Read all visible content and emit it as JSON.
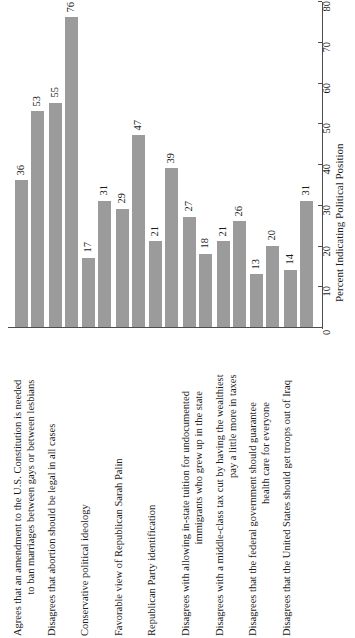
{
  "chart_data": {
    "type": "bar",
    "title": "",
    "subtitle": "",
    "xlabel": "",
    "ylabel": "Percent Indicating Political Position",
    "ylim": [
      0,
      80
    ],
    "yticks": [
      0,
      10,
      20,
      30,
      40,
      50,
      60,
      70,
      80
    ],
    "grid": false,
    "legend": "none",
    "orientation": "vertical-bars-rotated-page",
    "bar_color": "#9b9b9b",
    "categories": [
      "Agrees that an amendment to the U.S. Constitution is needed to ban marriages between gays or between lesbians",
      "Disagrees that abortion should be legal in all cases",
      "Conservative political ideology",
      "Favorable view of Republican Sarah Palin",
      "Republican Party identification",
      "Disagrees with allowing in-state tuition for undocumented immigrants who grew up in the state",
      "Disagrees with a middle-class tax cut by having the wealthiest pay a little more in taxes",
      "Disagrees that the federal government should guarantee health care for everyone",
      "Disagrees that the United States should get troops out of Iraq"
    ],
    "category_lines": [
      [
        "Agrees that an amendment to the U.S. Constitution is needed",
        "to ban marriages between gays or between lesbians"
      ],
      [
        "Disagrees that abortion should be legal in all cases"
      ],
      [
        "Conservative political ideology"
      ],
      [
        "Favorable view of Republican Sarah Palin"
      ],
      [
        "Republican Party identification"
      ],
      [
        "Disagrees with allowing in-state tuition for undocumented",
        "immigrants who grew up in the state"
      ],
      [
        "Disagrees with a middle-class tax cut by having the wealthiest",
        "pay a little more in taxes"
      ],
      [
        "Disagrees that the federal government should guarantee",
        "health care for everyone"
      ],
      [
        "Disagrees that the United States should get troops out of Iraq"
      ]
    ],
    "series": [
      {
        "name": "series-1",
        "values": [
          36,
          55,
          17,
          29,
          21,
          27,
          21,
          13,
          14
        ]
      },
      {
        "name": "series-2",
        "values": [
          53,
          76,
          31,
          47,
          39,
          18,
          26,
          20,
          31
        ]
      }
    ]
  }
}
